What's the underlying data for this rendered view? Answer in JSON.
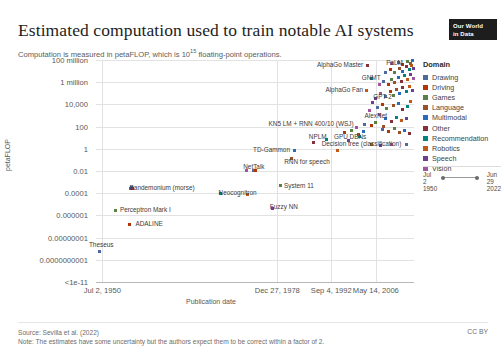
{
  "header": {
    "title": "Estimated computation used to train notable AI systems",
    "subtitle_pre": "Computation is measured in petaFLOP, which is 10",
    "subtitle_sup": "15",
    "subtitle_post": " floating-point operations.",
    "logo_line1": "Our World",
    "logo_line2": "in Data"
  },
  "legend": {
    "title": "Domain",
    "items": [
      {
        "label": "Drawing",
        "color": "#4c6a9c"
      },
      {
        "label": "Driving",
        "color": "#b13507"
      },
      {
        "label": "Games",
        "color": "#578145"
      },
      {
        "label": "Language",
        "color": "#9a5129"
      },
      {
        "label": "Multimodal",
        "color": "#286bbb"
      },
      {
        "label": "Other",
        "color": "#883039"
      },
      {
        "label": "Recommendation",
        "color": "#00847e"
      },
      {
        "label": "Robotics",
        "color": "#c05917"
      },
      {
        "label": "Speech",
        "color": "#6d3e91"
      },
      {
        "label": "Vision",
        "color": "#a2559c"
      }
    ]
  },
  "time_slider": {
    "start_line1": "Jul",
    "start_line2": "2",
    "start_line3": "1950",
    "end_line1": "Jun",
    "end_line2": "29",
    "end_line3": "2022"
  },
  "footer": {
    "source": "Source: Sevilla et al. (2022)",
    "note": "Note: The estimates have some uncertainty but the authors expect them to be correct within a factor of 2.",
    "license": "CC BY"
  },
  "chart_data": {
    "type": "scatter",
    "title": "Estimated computation used to train notable AI systems",
    "subtitle": "Computation is measured in petaFLOP, which is 10^15 floating-point operations.",
    "xlabel": "Publication date",
    "ylabel": "petaFLOP",
    "grid": true,
    "legend_position": "right",
    "y_scale": "log",
    "y_ticks": [
      "100 million",
      "1 million",
      "10,000",
      "100",
      "1",
      "0.01",
      "0.0001",
      "0.000001",
      "0.00000001",
      "0.0000000001",
      "<1e-11"
    ],
    "y_tick_values": [
      100000000.0,
      1000000.0,
      10000.0,
      100.0,
      1,
      0.01,
      0.0001,
      1e-06,
      1e-08,
      1e-10,
      1e-11
    ],
    "x_ticks": [
      "Jul 2, 1950",
      "Dec 27, 1978",
      "Sep 4, 1992",
      "May 14, 2006"
    ],
    "x_tick_positions_pct": [
      2,
      57,
      74,
      88
    ],
    "xlim": [
      "1950-07-02",
      "2022-06-29"
    ],
    "annotations": [
      {
        "text": "AlphaGo Master",
        "x": 84.0,
        "y": 4.0,
        "anchor": "r"
      },
      {
        "text": "PaLM",
        "x": 96.5,
        "y": 1.5,
        "anchor": "r"
      },
      {
        "text": "GNMT",
        "x": 89.5,
        "y": 17.0,
        "anchor": "r"
      },
      {
        "text": "AlphaGo Fan",
        "x": 84.0,
        "y": 29.0,
        "anchor": "r"
      },
      {
        "text": "GPT-2",
        "x": 93.0,
        "y": 36.0,
        "anchor": "r"
      },
      {
        "text": "AlexNet",
        "x": 91.5,
        "y": 55.0,
        "anchor": "r"
      },
      {
        "text": "KN5 LM + RNN 400/10 (WSJ)",
        "x": 81.0,
        "y": 63.0,
        "anchor": "r"
      },
      {
        "text": "NPLM",
        "x": 72.5,
        "y": 75.5,
        "anchor": "r"
      },
      {
        "text": "GPU DBNs",
        "x": 85.0,
        "y": 75.5,
        "anchor": "r"
      },
      {
        "text": "Decision tree (classification)",
        "x": 96.0,
        "y": 83.0,
        "anchor": "r"
      },
      {
        "text": "TD-Gammon",
        "x": 61.0,
        "y": 88.5,
        "anchor": "r"
      },
      {
        "text": "RNN for speech",
        "x": 73.5,
        "y": 101.0,
        "anchor": "r"
      },
      {
        "text": "NetTalk",
        "x": 53.0,
        "y": 106.0,
        "anchor": "r"
      },
      {
        "text": "Pandemonium (morse)",
        "x": 31.0,
        "y": 126.5,
        "anchor": "r"
      },
      {
        "text": "Neocognitron",
        "x": 50.5,
        "y": 131.5,
        "anchor": "r"
      },
      {
        "text": "System 11",
        "x": 68.5,
        "y": 125.0,
        "anchor": "r"
      },
      {
        "text": "Fuzzy NN",
        "x": 63.5,
        "y": 146.0,
        "anchor": "r"
      },
      {
        "text": "Perceptron Mark I",
        "x": 23.5,
        "y": 149.0,
        "anchor": "r"
      },
      {
        "text": "ADALINE",
        "x": 21.0,
        "y": 163.0,
        "anchor": "r"
      },
      {
        "text": "Theseus",
        "x": 5.5,
        "y": 184.0,
        "anchor": "r"
      }
    ],
    "points": [
      [
        1.0,
        191.0
      ],
      [
        10.5,
        164.5
      ],
      [
        6.2,
        150.5
      ],
      [
        10.8,
        128.5
      ],
      [
        11.3,
        127.5
      ],
      [
        11.6,
        128.0
      ],
      [
        39.0,
        133.5
      ],
      [
        47.5,
        134.5
      ],
      [
        55.5,
        148.5
      ],
      [
        47.2,
        110.0
      ],
      [
        49.5,
        110.5
      ],
      [
        50.3,
        110.3
      ],
      [
        58.0,
        125.5
      ],
      [
        61.5,
        98.0
      ],
      [
        62.5,
        90.2
      ],
      [
        68.5,
        82.8
      ],
      [
        72.5,
        79.0
      ],
      [
        76.0,
        90.0
      ],
      [
        79.5,
        80.0
      ],
      [
        82.0,
        67.5
      ],
      [
        84.5,
        64.5
      ],
      [
        86.5,
        65.5
      ],
      [
        88.0,
        62.0
      ],
      [
        90.5,
        66.0
      ],
      [
        91.0,
        58.5
      ],
      [
        93.0,
        61.5
      ],
      [
        94.5,
        57.0
      ],
      [
        96.0,
        60.5
      ],
      [
        97.5,
        58.0
      ],
      [
        86.0,
        50.0
      ],
      [
        88.5,
        47.5
      ],
      [
        90.0,
        44.0
      ],
      [
        91.5,
        48.5
      ],
      [
        93.5,
        45.0
      ],
      [
        95.0,
        43.0
      ],
      [
        96.5,
        49.0
      ],
      [
        98.0,
        46.0
      ],
      [
        99.0,
        41.0
      ],
      [
        88.0,
        38.0
      ],
      [
        89.5,
        33.5
      ],
      [
        91.0,
        36.5
      ],
      [
        92.5,
        31.0
      ],
      [
        93.5,
        35.0
      ],
      [
        94.5,
        29.5
      ],
      [
        95.5,
        33.0
      ],
      [
        96.5,
        27.5
      ],
      [
        97.5,
        31.5
      ],
      [
        98.5,
        26.0
      ],
      [
        99.5,
        30.0
      ],
      [
        89.0,
        24.5
      ],
      [
        90.5,
        21.0
      ],
      [
        92.0,
        24.0
      ],
      [
        93.0,
        19.0
      ],
      [
        94.0,
        22.5
      ],
      [
        95.0,
        17.5
      ],
      [
        96.0,
        21.0
      ],
      [
        97.0,
        15.5
      ],
      [
        98.0,
        19.5
      ],
      [
        99.0,
        14.0
      ],
      [
        99.8,
        18.0
      ],
      [
        91.0,
        12.0
      ],
      [
        92.5,
        9.5
      ],
      [
        94.0,
        12.5
      ],
      [
        95.5,
        8.0
      ],
      [
        96.5,
        11.0
      ],
      [
        97.5,
        6.5
      ],
      [
        98.5,
        9.5
      ],
      [
        99.2,
        5.0
      ],
      [
        99.9,
        8.0
      ],
      [
        93.0,
        3.5
      ],
      [
        95.0,
        2.0
      ],
      [
        96.5,
        4.5
      ],
      [
        98.0,
        1.5
      ],
      [
        99.0,
        3.0
      ],
      [
        99.6,
        0.8
      ],
      [
        85.5,
        5.5
      ],
      [
        86.5,
        18.5
      ],
      [
        85.0,
        30.0
      ],
      [
        87.0,
        42.0
      ],
      [
        89.0,
        54.0
      ],
      [
        90.0,
        69.0
      ],
      [
        92.0,
        71.0
      ],
      [
        94.0,
        68.0
      ],
      [
        95.5,
        72.5
      ],
      [
        97.0,
        70.0
      ],
      [
        98.5,
        73.5
      ],
      [
        83.0,
        76.5
      ],
      [
        86.5,
        84.5
      ],
      [
        89.5,
        85.5
      ],
      [
        93.0,
        84.0
      ],
      [
        97.5,
        84.5
      ],
      [
        78.0,
        72.0
      ],
      [
        80.5,
        70.5
      ],
      [
        82.5,
        74.0
      ],
      [
        84.0,
        71.5
      ]
    ]
  }
}
